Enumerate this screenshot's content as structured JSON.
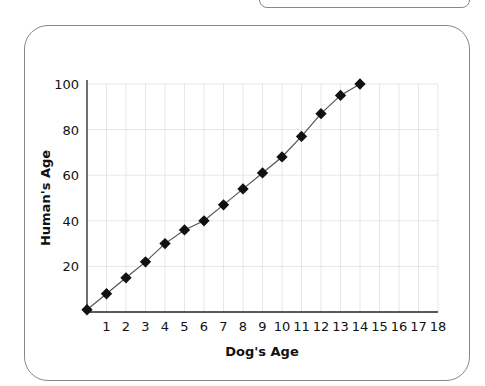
{
  "chart_data": {
    "type": "line",
    "title": "",
    "xlabel": "Dog's Age",
    "ylabel": "Human's Age",
    "x": [
      0,
      1,
      2,
      3,
      4,
      5,
      6,
      7,
      8,
      9,
      10,
      11,
      12,
      13,
      14
    ],
    "series": [
      {
        "name": "Human's Age",
        "values": [
          1,
          8,
          15,
          22,
          30,
          36,
          40,
          47,
          54,
          61,
          68,
          77,
          87,
          95,
          100
        ]
      }
    ],
    "xticks": [
      "1",
      "2",
      "3",
      "4",
      "5",
      "6",
      "7",
      "8",
      "9",
      "10",
      "11",
      "12",
      "13",
      "14",
      "15",
      "16",
      "17",
      "18"
    ],
    "yticks": [
      "20",
      "40",
      "60",
      "80",
      "100"
    ],
    "xlim": [
      0,
      18
    ],
    "ylim": [
      0,
      100
    ],
    "grid": true,
    "legend": "none",
    "marker": "diamond",
    "colors": {
      "line": "#555555",
      "marker": "#111111",
      "grid": "#e6e6e6",
      "axis": "#222222"
    }
  }
}
